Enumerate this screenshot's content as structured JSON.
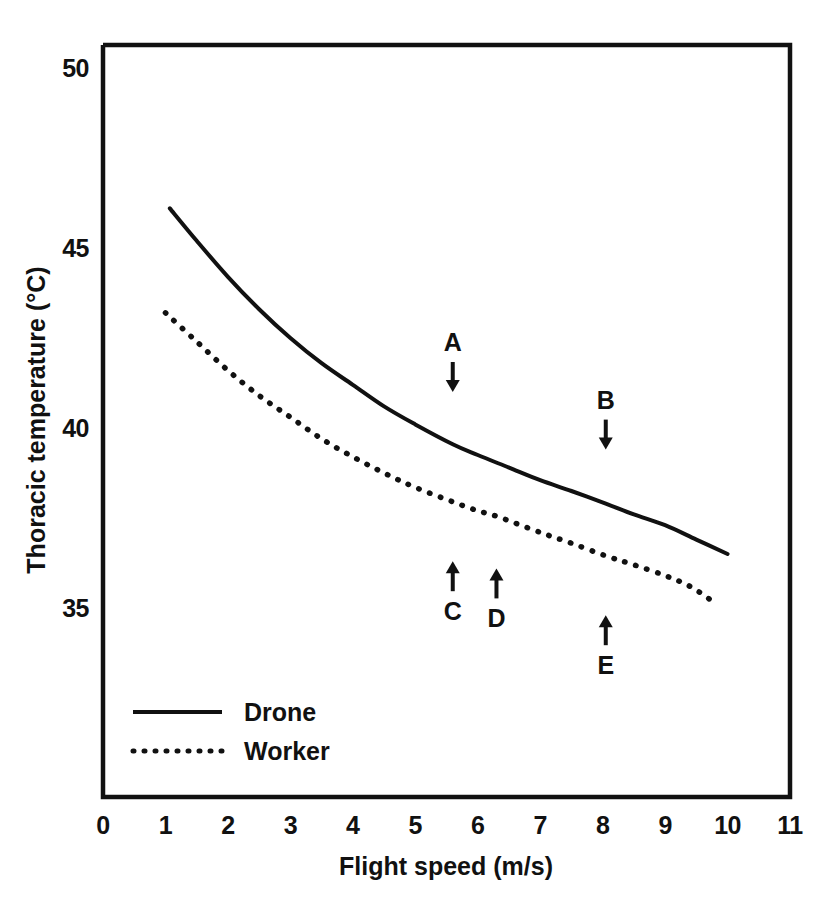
{
  "chart_data": {
    "type": "line",
    "title": "",
    "xlabel": "Flight speed (m/s)",
    "ylabel": "Thoracic temperature (°C)",
    "xlim": [
      0,
      11
    ],
    "ylim": [
      33,
      50
    ],
    "xticks": [
      "0",
      "1",
      "2",
      "3",
      "4",
      "5",
      "6",
      "7",
      "8",
      "9",
      "10",
      "11"
    ],
    "yticks": [
      "35",
      "40",
      "45",
      "50"
    ],
    "grid": false,
    "legend_position": "inside-bottom-left",
    "series": [
      {
        "name": "Drone",
        "style": "solid",
        "color": "#111111",
        "x": [
          1.07,
          1.5,
          2.0,
          2.5,
          3.0,
          3.5,
          4.0,
          4.5,
          5.0,
          5.6,
          6.0,
          6.5,
          7.0,
          7.5,
          8.05,
          8.5,
          9.0,
          9.5,
          10.0
        ],
        "y": [
          46.1,
          45.2,
          44.2,
          43.3,
          42.5,
          41.8,
          41.2,
          40.6,
          40.1,
          39.55,
          39.25,
          38.9,
          38.55,
          38.25,
          37.9,
          37.6,
          37.3,
          36.9,
          36.5
        ]
      },
      {
        "name": "Worker",
        "style": "dotted",
        "color": "#111111",
        "x": [
          1.0,
          1.5,
          2.0,
          2.5,
          3.0,
          3.5,
          4.0,
          4.5,
          5.0,
          5.6,
          6.0,
          6.3,
          7.0,
          7.5,
          8.05,
          8.5,
          9.0,
          9.4,
          9.75
        ],
        "y": [
          43.2,
          42.4,
          41.6,
          40.9,
          40.3,
          39.7,
          39.2,
          38.75,
          38.35,
          37.95,
          37.7,
          37.55,
          37.1,
          36.8,
          36.45,
          36.2,
          35.9,
          35.6,
          35.2
        ]
      }
    ],
    "annotations": [
      {
        "label": "A",
        "x": 5.6,
        "y": 41.0,
        "direction": "down",
        "target_series": "Drone"
      },
      {
        "label": "B",
        "x": 8.05,
        "y": 39.4,
        "direction": "down",
        "target_series": "Drone"
      },
      {
        "label": "C",
        "x": 5.6,
        "y": 36.3,
        "direction": "up",
        "target_series": "Worker"
      },
      {
        "label": "D",
        "x": 6.3,
        "y": 36.1,
        "direction": "up",
        "target_series": "Worker"
      },
      {
        "label": "E",
        "x": 8.05,
        "y": 34.8,
        "direction": "up",
        "target_series": "Worker"
      }
    ]
  },
  "legend": {
    "entries": [
      {
        "label": "Drone",
        "style": "solid"
      },
      {
        "label": "Worker",
        "style": "dotted"
      }
    ]
  }
}
